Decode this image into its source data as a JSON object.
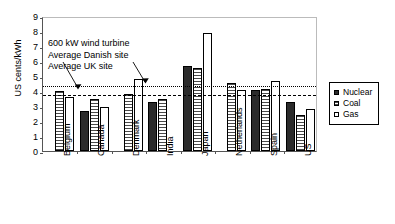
{
  "chart_data": {
    "type": "bar",
    "title": "",
    "xlabel": "",
    "ylabel": "US cents/kWh",
    "ylim": [
      0,
      9
    ],
    "yticks": [
      0,
      1,
      2,
      3,
      4,
      5,
      6,
      7,
      8,
      9
    ],
    "ytick_labels": [
      "0",
      "1",
      "2",
      "3",
      "4",
      "5",
      "6",
      "7",
      "8",
      "9"
    ],
    "grid": false,
    "legend_position": "right",
    "categories": [
      "Belgium",
      "Canada",
      "Denmark",
      "India",
      "Japan",
      "Netherlands",
      "Spain",
      "US"
    ],
    "series": [
      {
        "name": "Nuclear",
        "color": "#2b2b2b",
        "values": [
          null,
          2.7,
          null,
          3.25,
          5.7,
          null,
          4.05,
          3.25
        ]
      },
      {
        "name": "Coal",
        "color": "#4a4a4a",
        "values": [
          4.0,
          3.5,
          3.8,
          3.5,
          5.55,
          4.55,
          4.15,
          2.4
        ]
      },
      {
        "name": "Gas",
        "color": "#ffffff",
        "values": [
          3.6,
          2.95,
          4.8,
          null,
          7.85,
          4.05,
          4.7,
          2.8
        ]
      }
    ],
    "reference_lines": [
      {
        "label": "Average UK site",
        "value": 4.45,
        "style": "dotted"
      },
      {
        "label": "Average Danish site",
        "value": 3.9,
        "style": "dashed"
      }
    ],
    "annotations": [
      {
        "id": "annotation-line-1",
        "text": "600 kW wind turbine"
      },
      {
        "id": "annotation-line-2",
        "text": "Average Danish site"
      },
      {
        "id": "annotation-line-3",
        "text": "Average UK site"
      }
    ]
  },
  "axis": {
    "y_title": "US cents/kWh"
  },
  "legend": {
    "items": [
      {
        "label": "Nuclear",
        "swatch": "nuclear-swatch-icon"
      },
      {
        "label": "Coal",
        "swatch": "coal-swatch-icon"
      },
      {
        "label": "Gas",
        "swatch": "gas-swatch-icon"
      }
    ]
  }
}
